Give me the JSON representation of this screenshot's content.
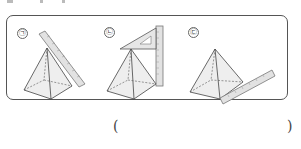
{
  "figures": [
    {
      "label": "㉠",
      "description": "pyramid with ruler placed along slanted face edge"
    },
    {
      "label": "㉡",
      "description": "pyramid with triangle set square on apex and vertical ruler"
    },
    {
      "label": "㉢",
      "description": "pyramid with ruler along base edge"
    }
  ],
  "answer": {
    "open": "(",
    "close": ")",
    "value": ""
  }
}
